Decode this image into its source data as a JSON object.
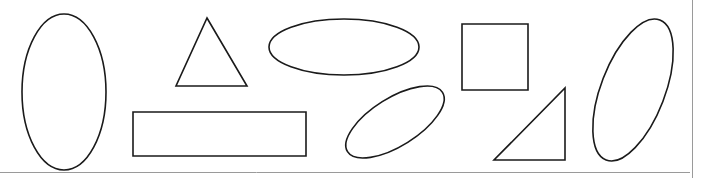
{
  "canvas": {
    "width": 702,
    "height": 178,
    "background_color": "#ffffff",
    "title": "Geometric Shapes Canvas",
    "stroke_color": "#1a1a1a",
    "stroke_width": 1.6,
    "fill": "none",
    "shape_count": 9
  },
  "borders": {
    "bottom_rule": {
      "name": "bottom-divider",
      "color": "#9a9a9a",
      "x1": 0,
      "y1": 172.5,
      "x2": 690,
      "y2": 172.5
    },
    "right_rule": {
      "name": "right-divider",
      "color": "#9a9a9a",
      "x1": 692.5,
      "y1": 0,
      "x2": 692.5,
      "y2": 178
    }
  },
  "shapes": [
    {
      "id": "shape-1",
      "name": "tall-ellipse-left",
      "kind": "ellipse",
      "label": "Tall vertical ellipse",
      "cx": 64,
      "cy": 92,
      "rx": 42,
      "ry": 78,
      "rotation": 0
    },
    {
      "id": "shape-2",
      "name": "equilateral-triangle",
      "kind": "polygon",
      "label": "Upward triangle",
      "points": "207,18 247,86 176,86",
      "rotation": 0
    },
    {
      "id": "shape-3",
      "name": "wide-rectangle",
      "kind": "rect",
      "label": "Wide rectangle",
      "x": 133,
      "y": 112,
      "width": 173,
      "height": 44,
      "rotation": 0
    },
    {
      "id": "shape-4",
      "name": "wide-ellipse-top",
      "kind": "ellipse",
      "label": "Wide horizontal ellipse",
      "cx": 344,
      "cy": 47,
      "rx": 75,
      "ry": 28,
      "rotation": 0
    },
    {
      "id": "shape-5",
      "name": "tilted-ellipse-small",
      "kind": "ellipse",
      "label": "Small tilted ellipse",
      "cx": 395,
      "cy": 122,
      "rx": 56,
      "ry": 24,
      "rotation": -32
    },
    {
      "id": "shape-6",
      "name": "square",
      "kind": "rect",
      "label": "Square",
      "x": 462,
      "y": 24,
      "width": 66,
      "height": 66,
      "rotation": 0
    },
    {
      "id": "shape-7",
      "name": "right-triangle",
      "kind": "polygon",
      "label": "Right triangle",
      "points": "565,88 565,160 494,160",
      "rotation": 0
    },
    {
      "id": "shape-8",
      "name": "tilted-ellipse-tall-right",
      "kind": "ellipse",
      "label": "Tall tilted ellipse",
      "cx": 633,
      "cy": 90,
      "rx": 32,
      "ry": 75,
      "rotation": 21
    }
  ]
}
